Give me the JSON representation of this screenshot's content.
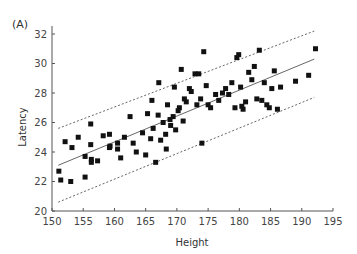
{
  "chart_data": {
    "type": "scatter",
    "panel_label": "(A)",
    "title": "",
    "xlabel": "Height",
    "ylabel": "Latency",
    "xlim": [
      150,
      195
    ],
    "ylim": [
      20,
      33
    ],
    "xticks": [
      150,
      155,
      160,
      165,
      170,
      175,
      180,
      185,
      190,
      195
    ],
    "yticks": [
      20,
      22,
      24,
      26,
      28,
      30,
      32
    ],
    "grid": false,
    "legend": null,
    "marker": "square",
    "marker_color": "#111111",
    "series": [
      {
        "name": "observations",
        "points": [
          [
            151.1,
            22.7
          ],
          [
            151.4,
            22.1
          ],
          [
            153.0,
            22.0
          ],
          [
            152.1,
            24.7
          ],
          [
            153.2,
            24.3
          ],
          [
            154.2,
            25.0
          ],
          [
            155.3,
            23.7
          ],
          [
            155.3,
            22.3
          ],
          [
            156.2,
            25.9
          ],
          [
            156.2,
            24.5
          ],
          [
            156.3,
            23.5
          ],
          [
            156.3,
            23.3
          ],
          [
            157.3,
            23.4
          ],
          [
            158.2,
            25.1
          ],
          [
            159.2,
            25.2
          ],
          [
            159.2,
            24.3
          ],
          [
            159.3,
            24.4
          ],
          [
            160.5,
            24.6
          ],
          [
            160.5,
            24.2
          ],
          [
            161.0,
            23.6
          ],
          [
            161.6,
            25.0
          ],
          [
            162.5,
            26.4
          ],
          [
            163.0,
            24.6
          ],
          [
            163.5,
            24.0
          ],
          [
            164.5,
            25.3
          ],
          [
            165.0,
            23.8
          ],
          [
            165.3,
            26.6
          ],
          [
            165.8,
            24.9
          ],
          [
            166.0,
            27.5
          ],
          [
            166.2,
            25.6
          ],
          [
            166.6,
            23.3
          ],
          [
            167.0,
            26.5
          ],
          [
            167.1,
            28.7
          ],
          [
            167.4,
            24.8
          ],
          [
            167.8,
            26.0
          ],
          [
            168.2,
            25.2
          ],
          [
            168.3,
            24.2
          ],
          [
            168.5,
            27.2
          ],
          [
            168.9,
            26.2
          ],
          [
            169.0,
            25.8
          ],
          [
            169.4,
            26.4
          ],
          [
            169.6,
            28.4
          ],
          [
            169.8,
            25.5
          ],
          [
            170.2,
            26.8
          ],
          [
            170.4,
            27.0
          ],
          [
            170.7,
            29.6
          ],
          [
            171.0,
            26.1
          ],
          [
            171.2,
            27.6
          ],
          [
            171.5,
            27.4
          ],
          [
            172.0,
            28.3
          ],
          [
            172.3,
            28.1
          ],
          [
            172.9,
            29.3
          ],
          [
            173.2,
            27.2
          ],
          [
            173.5,
            29.3
          ],
          [
            173.8,
            27.6
          ],
          [
            174.0,
            24.6
          ],
          [
            174.3,
            30.8
          ],
          [
            174.7,
            28.5
          ],
          [
            175.0,
            27.2
          ],
          [
            175.4,
            27.0
          ],
          [
            176.2,
            27.9
          ],
          [
            176.7,
            27.5
          ],
          [
            177.3,
            28.0
          ],
          [
            177.8,
            28.3
          ],
          [
            178.3,
            27.9
          ],
          [
            178.8,
            28.7
          ],
          [
            179.3,
            27.0
          ],
          [
            179.6,
            30.4
          ],
          [
            179.9,
            30.6
          ],
          [
            180.2,
            28.4
          ],
          [
            180.4,
            27.1
          ],
          [
            180.6,
            26.9
          ],
          [
            181.0,
            27.4
          ],
          [
            181.5,
            29.4
          ],
          [
            182.0,
            28.9
          ],
          [
            182.4,
            29.8
          ],
          [
            182.8,
            27.6
          ],
          [
            183.2,
            30.9
          ],
          [
            183.6,
            27.5
          ],
          [
            184.0,
            28.7
          ],
          [
            184.4,
            27.2
          ],
          [
            184.8,
            27.0
          ],
          [
            185.2,
            28.3
          ],
          [
            185.6,
            29.5
          ],
          [
            186.1,
            26.9
          ],
          [
            186.6,
            28.4
          ],
          [
            191.1,
            29.2
          ],
          [
            192.2,
            31.0
          ],
          [
            189.0,
            28.8
          ]
        ]
      }
    ],
    "lines": [
      {
        "name": "regression",
        "style": "solid",
        "color": "#666666",
        "from": [
          151,
          23.1
        ],
        "to": [
          192,
          30.3
        ]
      },
      {
        "name": "upper-bound",
        "style": "dotted",
        "color": "#666666",
        "from": [
          151,
          25.6
        ],
        "to": [
          192,
          32.2
        ]
      },
      {
        "name": "lower-bound",
        "style": "dotted",
        "color": "#666666",
        "from": [
          151,
          20.6
        ],
        "to": [
          192,
          27.7
        ]
      }
    ]
  },
  "layout": {
    "plot_left": 52,
    "plot_right": 333,
    "plot_top": 26,
    "plot_bottom": 211,
    "axis_color": "#555555"
  }
}
